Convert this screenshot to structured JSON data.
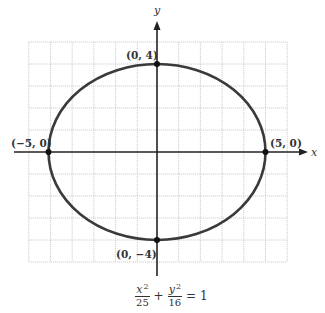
{
  "diagram": {
    "type": "ellipse-graph",
    "axes": {
      "x_label": "x",
      "y_label": "y"
    },
    "grid": {
      "x_min": -6,
      "x_max": 6,
      "y_min": -5,
      "y_max": 5,
      "step": 1,
      "visible": true
    },
    "ellipse": {
      "center": [
        0,
        0
      ],
      "a": 5,
      "b": 4,
      "stroke_color": "#3a3a3a"
    },
    "points": [
      {
        "label": "(0, 4)",
        "x": 0,
        "y": 4
      },
      {
        "label": "(−5, 0)",
        "x": -5,
        "y": 0
      },
      {
        "label": "(5, 0)",
        "x": 5,
        "y": 0
      },
      {
        "label": "(0, −4)",
        "x": 0,
        "y": -4
      }
    ],
    "equation": {
      "term1_num": "x",
      "term1_exp": "2",
      "term1_den": "25",
      "plus": "+",
      "term2_num": "y",
      "term2_exp": "2",
      "term2_den": "16",
      "equals": "=",
      "rhs": "1"
    },
    "colors": {
      "grid": "#c9c9c9",
      "axis": "#222222",
      "curve": "#3a3a3a",
      "point": "#111111"
    }
  }
}
